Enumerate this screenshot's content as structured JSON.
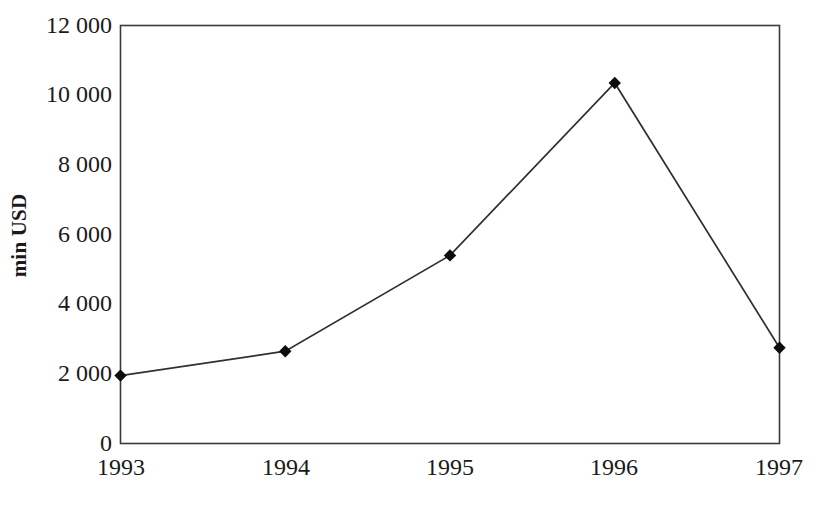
{
  "chart_data": {
    "type": "line",
    "title": "",
    "xlabel": "",
    "ylabel": "min USD",
    "categories": [
      "1993",
      "1994",
      "1995",
      "1996",
      "1997"
    ],
    "values": [
      1950,
      2650,
      5400,
      10350,
      2750
    ],
    "series": [
      {
        "name": "min USD",
        "values": [
          1950,
          2650,
          5400,
          10350,
          2750
        ]
      }
    ],
    "ylim": [
      0,
      12000
    ],
    "ytick_labels": [
      "12 000",
      "10 000",
      "8 000",
      "6 000",
      "4 000",
      "2 000",
      "0"
    ],
    "ytick_values": [
      12000,
      10000,
      8000,
      6000,
      4000,
      2000,
      0
    ],
    "xtick_labels": [
      "1993",
      "1994",
      "1995",
      "1996",
      "1997"
    ],
    "grid": false,
    "legend": false,
    "legend_position": "none",
    "marker": "diamond",
    "line_color": "#303030",
    "marker_color": "#0d0d0d",
    "border_color": "#3a3a3a",
    "background_color": "#ffffff"
  }
}
